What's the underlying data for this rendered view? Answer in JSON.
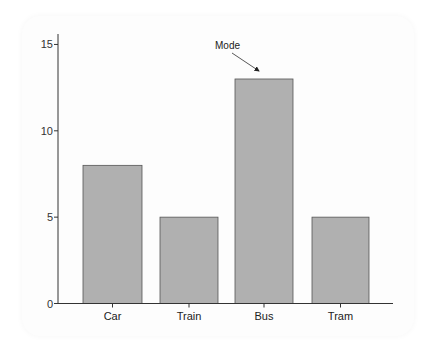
{
  "chart_data": {
    "type": "bar",
    "title": "",
    "xlabel": "",
    "ylabel": "",
    "categories": [
      "Car",
      "Train",
      "Bus",
      "Tram"
    ],
    "values": [
      8,
      5,
      13,
      5
    ],
    "ylim": [
      0,
      15.5
    ],
    "yticks": [
      0,
      5,
      10,
      15
    ],
    "grid": false,
    "legend": null,
    "bar_color": "#b0b0b0",
    "bar_edge_color": "#555555",
    "annotations": [
      {
        "text": "Mode",
        "target_category": "Bus",
        "arrow": true
      }
    ]
  },
  "axis": {
    "yticks": [
      {
        "value": 0,
        "label": "0"
      },
      {
        "value": 5,
        "label": "5"
      },
      {
        "value": 10,
        "label": "10"
      },
      {
        "value": 15,
        "label": "15"
      }
    ]
  },
  "bars": [
    {
      "category": "Car",
      "value": 8
    },
    {
      "category": "Train",
      "value": 5
    },
    {
      "category": "Bus",
      "value": 13
    },
    {
      "category": "Tram",
      "value": 5
    }
  ],
  "annotation": {
    "label": "Mode"
  }
}
